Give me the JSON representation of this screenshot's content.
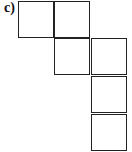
{
  "figure": {
    "label": "c)",
    "squares": [
      {
        "row": 0,
        "col": 0
      },
      {
        "row": 0,
        "col": 1
      },
      {
        "row": 1,
        "col": 1
      },
      {
        "row": 1,
        "col": 2
      },
      {
        "row": 2,
        "col": 2
      },
      {
        "row": 3,
        "col": 2
      }
    ],
    "line_color": "#222222"
  }
}
